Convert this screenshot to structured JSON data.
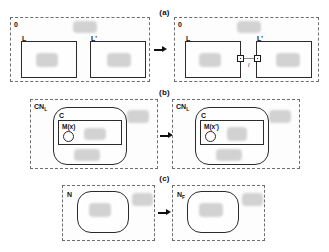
{
  "figure": {
    "background": "#ffffff",
    "stroke": "#2b2b2b",
    "dashed_stroke": "#6e6e6e",
    "blob_color": "#cfcfcf",
    "link_color": "#8c8c8c"
  },
  "panels": [
    {
      "id": "a",
      "caption": "(a)",
      "before": {
        "outer_label": "0",
        "boxes": [
          {
            "label": "L"
          },
          {
            "label": "L'"
          }
        ]
      },
      "after": {
        "outer_label": "0",
        "boxes": [
          {
            "label": "L"
          },
          {
            "label": "L'"
          }
        ],
        "link_label": "l"
      }
    },
    {
      "id": "b",
      "caption": "(b)",
      "before": {
        "outer_label": "CN",
        "outer_label_sub": "L",
        "container_label": "C",
        "node_label": "M(x)"
      },
      "after": {
        "outer_label": "CN",
        "outer_label_sub": "L",
        "container_label": "C",
        "node_label": "M(x')"
      }
    },
    {
      "id": "c",
      "caption": "(c)",
      "before": {
        "outer_label": "N",
        "outer_label_sub": ""
      },
      "after": {
        "outer_label": "N",
        "outer_label_sub": "F"
      }
    }
  ],
  "arrows": {
    "glyph": "arrow-right-icon",
    "count": 3
  }
}
